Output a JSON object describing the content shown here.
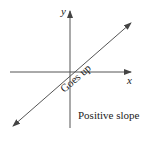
{
  "diagram": {
    "title": "Positive slope",
    "line_label": "Goes up",
    "x_axis_label": "x",
    "y_axis_label": "y",
    "colors": {
      "axis": "#555555",
      "line": "#555555",
      "text": "#222222",
      "background": "#ffffff"
    },
    "elements": [
      {
        "type": "axis",
        "name": "x-axis",
        "direction": "horizontal",
        "arrow": "right"
      },
      {
        "type": "axis",
        "name": "y-axis",
        "direction": "vertical",
        "arrow": "up"
      },
      {
        "type": "line",
        "name": "positive-slope-line",
        "arrows": "both",
        "slope": "positive"
      }
    ]
  }
}
